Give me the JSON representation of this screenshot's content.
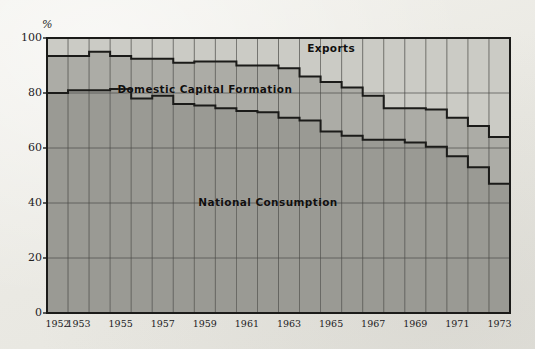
{
  "page": {
    "background_color": "#eeede8",
    "kind": "scanned-figure"
  },
  "colors": {
    "consumption": "#9a9a94",
    "capital_formation": "#acaca6",
    "exports": "#cbcbc5",
    "outline": "#1b1b19",
    "grid": "#4a4a46",
    "text": "#23221f"
  },
  "chart_data": {
    "type": "area",
    "stacked": true,
    "normalized_percent": true,
    "title": "",
    "subtitle": "",
    "xlabel": "",
    "ylabel": "%",
    "ylim": [
      0,
      100
    ],
    "yticks": [
      0,
      20,
      40,
      60,
      80,
      100
    ],
    "ytick_labels": [
      "0",
      "20",
      "40",
      "60",
      "80",
      "100"
    ],
    "grid": true,
    "grid_axis": "both",
    "legend": "inline-annotations",
    "x": [
      1952,
      1953,
      1954,
      1955,
      1956,
      1957,
      1958,
      1959,
      1960,
      1961,
      1962,
      1963,
      1964,
      1965,
      1966,
      1967,
      1968,
      1969,
      1970,
      1971,
      1972,
      1973
    ],
    "xtick_labels": [
      "1952",
      "1953",
      "1955",
      "1957",
      "1959",
      "1961",
      "1963",
      "1965",
      "1967",
      "1969",
      "1971",
      "1973"
    ],
    "xtick_years": [
      1952,
      1953,
      1955,
      1957,
      1959,
      1961,
      1963,
      1965,
      1967,
      1969,
      1971,
      1973
    ],
    "annotations": [
      {
        "text": "Exports",
        "year": 1965,
        "value": 96
      },
      {
        "text": "Domestic  Capital  Formation",
        "year": 1959,
        "value": 81
      },
      {
        "text": "National  Consumption",
        "year": 1962,
        "value": 40
      }
    ],
    "series": [
      {
        "name": "National Consumption",
        "color": "#9a9a94",
        "order": 1,
        "values": [
          80,
          81,
          81,
          81.5,
          78,
          79,
          76,
          75.5,
          74.5,
          73.5,
          73,
          71,
          70,
          66,
          64.5,
          63,
          63,
          62,
          60.5,
          57,
          53,
          47
        ]
      },
      {
        "name": "Domestic Capital Formation",
        "color": "#acaca6",
        "order": 2,
        "values": [
          13.5,
          12.5,
          14,
          12,
          14.5,
          13.5,
          15,
          16,
          17,
          16.5,
          17,
          18,
          16,
          18,
          17.5,
          16,
          11.5,
          12.5,
          13.5,
          14,
          15,
          17
        ]
      },
      {
        "name": "Exports",
        "color": "#cbcbc5",
        "order": 3,
        "values": [
          6.5,
          6.5,
          5,
          6.5,
          7.5,
          7.5,
          9,
          8.5,
          8.5,
          10,
          10,
          11,
          14,
          16,
          18,
          21,
          25.5,
          25.5,
          26,
          29,
          32,
          36
        ]
      }
    ],
    "cumulative_tops": {
      "consumption": [
        80,
        81,
        81,
        81.5,
        78,
        79,
        76,
        75.5,
        74.5,
        73.5,
        73,
        71,
        70,
        66,
        64.5,
        63,
        63,
        62,
        60.5,
        57,
        53,
        47
      ],
      "capital_formation": [
        93.5,
        93.5,
        95,
        93.5,
        92.5,
        92.5,
        91,
        91.5,
        91.5,
        90,
        90,
        89,
        86,
        84,
        82,
        79,
        74.5,
        74.5,
        74,
        71,
        68,
        64
      ]
    }
  }
}
